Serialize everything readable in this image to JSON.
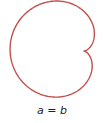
{
  "figure": {
    "type": "cardioid",
    "curve_color": "#c0504d",
    "stroke_width": 1.4,
    "cusp": {
      "x": 84,
      "y": 51
    },
    "a": 37,
    "rotation_deg": 4
  },
  "caption": {
    "left": "a",
    "operator": "=",
    "right": "b"
  }
}
